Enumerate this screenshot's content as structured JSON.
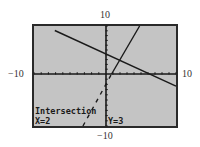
{
  "chart_data": {
    "type": "line",
    "title": "",
    "xlabel": "",
    "ylabel": "",
    "xlim": [
      -10,
      10
    ],
    "ylim": [
      -10,
      10
    ],
    "xtick_step": 1,
    "ytick_step": 1,
    "grid": false,
    "window_labels": {
      "xmin": "−10",
      "xmax": "10",
      "ymin": "−10",
      "ymax": "10"
    },
    "series": [
      {
        "name": "line-1",
        "slope": -0.6667,
        "intercept": 4.3333,
        "style": "solid"
      },
      {
        "name": "line-2",
        "slope": 2.5,
        "intercept": -2,
        "style": "solid-to-dashed"
      }
    ],
    "annotation": {
      "label": "Intersection",
      "x_text": "X=2",
      "y_text": "Y=3",
      "point": [
        2,
        3
      ]
    },
    "colors": {
      "screen": "#c4c4c4",
      "ink": "#1a1a1a",
      "frame": "#2a2a2a"
    }
  }
}
